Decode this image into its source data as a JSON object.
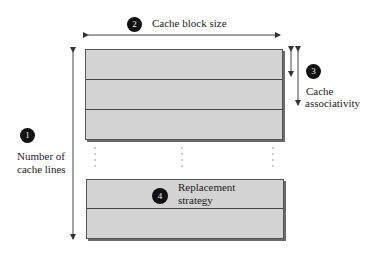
{
  "labels": {
    "number_of_lines": {
      "badge": "1",
      "line1": "Number of",
      "line2": "cache lines"
    },
    "block_size": {
      "badge": "2",
      "text": "Cache block size"
    },
    "associativity": {
      "badge": "3",
      "line1": "Cache",
      "line2": "associativity"
    },
    "replacement": {
      "badge": "4",
      "line1": "Replacement",
      "line2": "strategy"
    }
  },
  "colors": {
    "block_fill": "#d3d3d3",
    "line": "#444444",
    "badge": "#111111"
  }
}
